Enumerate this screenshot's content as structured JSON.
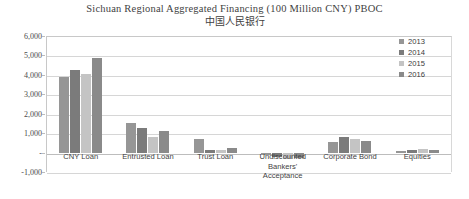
{
  "chart_data": {
    "type": "bar",
    "title": "Sichuan Regional Aggregated Financing (100 Million CNY) PBOC",
    "subtitle": "中国人民银行",
    "xlabel": "",
    "ylabel": "",
    "ylim": [
      -1000,
      6000
    ],
    "ytick_step": 1000,
    "grid": true,
    "legend_position": "right-top",
    "categories": [
      "CNY Loan",
      "Entrusted Loan",
      "Trust Loan",
      "Undiscounted Bankers' Acceptance",
      "Corporate Bond",
      "Equities"
    ],
    "ytick_labels": [
      "6,000",
      "5,000",
      "4,000",
      "3,000",
      "2,000",
      "1,000",
      "-",
      "-1,000"
    ],
    "ytick_values": [
      6000,
      5000,
      4000,
      3000,
      2000,
      1000,
      0,
      -1000
    ],
    "series": [
      {
        "name": "2013",
        "color": "#969696",
        "values": [
          3900,
          1500,
          700,
          -120,
          550,
          60
        ]
      },
      {
        "name": "2014",
        "color": "#7b7b7b",
        "values": [
          4250,
          1280,
          150,
          -250,
          820,
          110
        ]
      },
      {
        "name": "2015",
        "color": "#c4c4c4",
        "values": [
          4020,
          800,
          120,
          -330,
          700,
          170
        ]
      },
      {
        "name": "2016",
        "color": "#8a8a8a",
        "values": [
          4880,
          1120,
          230,
          -300,
          600,
          120
        ]
      }
    ]
  },
  "legend": {
    "items": [
      {
        "label": "2013",
        "color": "#969696"
      },
      {
        "label": "2014",
        "color": "#7b7b7b"
      },
      {
        "label": "2015",
        "color": "#c4c4c4"
      },
      {
        "label": "2016",
        "color": "#8a8a8a"
      }
    ]
  }
}
